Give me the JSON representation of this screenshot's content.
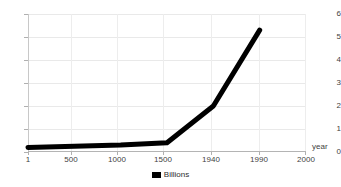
{
  "chart_data": {
    "type": "line",
    "title": "",
    "subtitle": "",
    "xlabel": "year",
    "ylabel": "",
    "categories": [
      "1",
      "500",
      "1000",
      "1500",
      "1940",
      "1990",
      "2000"
    ],
    "series": [
      {
        "name": "Billions",
        "values": [
          0.2,
          0.25,
          0.3,
          0.4,
          2.0,
          5.3,
          null
        ],
        "color": "#000000"
      }
    ],
    "ylim": [
      0,
      6
    ],
    "yticks": [
      "0",
      "1",
      "2",
      "3",
      "4",
      "5",
      "6"
    ],
    "grid": true,
    "legend": {
      "position": "bottom",
      "entries": [
        {
          "label": "Billions",
          "color": "#000000",
          "marker": "square"
        }
      ]
    },
    "axis_colors": {
      "grid": "#e9e9e9",
      "axis": "#b4b4b4",
      "text": "#3f3f3f"
    }
  }
}
